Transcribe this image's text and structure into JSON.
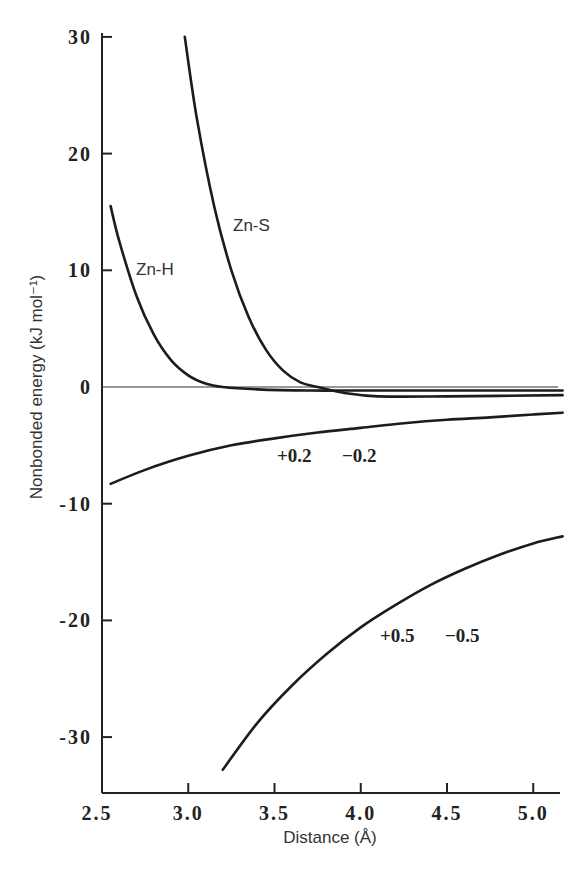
{
  "chart_data": {
    "type": "line",
    "title": "",
    "xlabel": "Distance (Å)",
    "ylabel": "Nonbonded energy (kJ mol⁻¹)",
    "xlim": [
      2.5,
      5.2
    ],
    "ylim": [
      -35,
      30
    ],
    "grid": false,
    "x_ticks": [
      "2.5",
      "3.0",
      "3.5",
      "4.0",
      "4.5",
      "5.0"
    ],
    "y_ticks": [
      "30",
      "20",
      "10",
      "0",
      "-10",
      "-20",
      "-30"
    ],
    "series": [
      {
        "name": "Zn-H",
        "x": [
          2.55,
          2.6,
          2.7,
          2.8,
          2.9,
          3.0,
          3.1,
          3.2,
          3.4,
          3.7,
          4.0,
          4.5,
          5.17
        ],
        "values": [
          15.5,
          12.5,
          7.8,
          4.5,
          2.3,
          1.0,
          0.3,
          0.0,
          -0.2,
          -0.3,
          -0.3,
          -0.3,
          -0.3
        ]
      },
      {
        "name": "Zn-S",
        "x": [
          2.98,
          3.05,
          3.15,
          3.25,
          3.35,
          3.45,
          3.55,
          3.65,
          3.75,
          3.9,
          4.1,
          4.5,
          5.17
        ],
        "values": [
          30,
          23,
          15.5,
          10,
          6,
          3.2,
          1.4,
          0.4,
          0.0,
          -0.5,
          -0.8,
          -0.8,
          -0.7
        ]
      },
      {
        "name": "+0.2 -0.2",
        "x": [
          2.55,
          2.75,
          3.0,
          3.25,
          3.5,
          3.75,
          4.0,
          4.25,
          4.5,
          4.75,
          5.0,
          5.17
        ],
        "values": [
          -8.3,
          -7.1,
          -5.9,
          -5.0,
          -4.4,
          -3.9,
          -3.5,
          -3.1,
          -2.8,
          -2.6,
          -2.35,
          -2.2
        ]
      },
      {
        "name": "+0.5 -0.5",
        "x": [
          3.2,
          3.4,
          3.6,
          3.8,
          4.0,
          4.2,
          4.4,
          4.6,
          4.8,
          5.0,
          5.17
        ],
        "values": [
          -32.8,
          -28.8,
          -25.6,
          -22.9,
          -20.6,
          -18.7,
          -17.0,
          -15.6,
          -14.4,
          -13.4,
          -12.8
        ]
      }
    ],
    "annotations": [
      "Zn-H",
      "Zn-S",
      "+0.2  −0.2",
      "+0.5  −0.5"
    ]
  },
  "labels": {
    "x_axis_title": "Distance (Å)",
    "y_axis_title": "Nonbonded energy (kJ mol⁻¹)",
    "zn_h": "Zn-H",
    "zn_s": "Zn-S",
    "charge_02_pos": "+0.2",
    "charge_02_neg": "−0.2",
    "charge_05_pos": "+0.5",
    "charge_05_neg": "−0.5"
  }
}
